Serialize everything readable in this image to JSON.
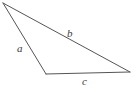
{
  "figure": {
    "kind": "triangle-diagram",
    "background_color": "#ffffff",
    "stroke_color": "#555555",
    "stroke_width": 1,
    "label_color": "#3a3a3a",
    "canvas": {
      "width": 136,
      "height": 93
    }
  },
  "shape": {
    "type": "triangle",
    "vertices": [
      {
        "name": "apex-top-left",
        "x": 3,
        "y": 3
      },
      {
        "name": "vertex-bottom-left",
        "x": 46,
        "y": 74
      },
      {
        "name": "vertex-right",
        "x": 130,
        "y": 72
      }
    ],
    "path": "M 3,3 L 46,74 L 130,72 Z"
  },
  "sides": [
    {
      "id": "side-a",
      "label": "a",
      "from": "apex-top-left",
      "to": "vertex-bottom-left",
      "label_x": 17,
      "label_y": 43
    },
    {
      "id": "side-b",
      "label": "b",
      "from": "apex-top-left",
      "to": "vertex-right",
      "label_x": 67,
      "label_y": 28
    },
    {
      "id": "side-c",
      "label": "c",
      "from": "vertex-bottom-left",
      "to": "vertex-right",
      "label_x": 82,
      "label_y": 76
    }
  ]
}
